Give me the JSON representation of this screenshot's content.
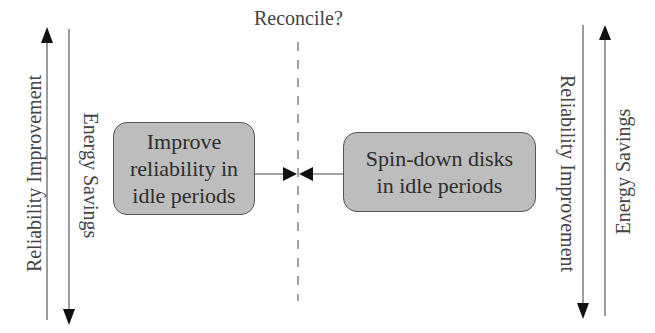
{
  "title": "Reconcile?",
  "left": {
    "axis_outer_label": "Reliability Improvement",
    "axis_inner_label": "Energy Savings",
    "box_lines": [
      "Improve",
      "reliability in",
      "idle periods"
    ]
  },
  "right": {
    "axis_outer_label": "Reliability Improvement",
    "axis_inner_label": "Energy Savings",
    "box_lines": [
      "Spin-down disks",
      "in idle periods"
    ]
  },
  "colors": {
    "box_fill": "#bdbdbd",
    "box_border": "#555555",
    "line": "#555555",
    "arrowhead": "#111111"
  }
}
